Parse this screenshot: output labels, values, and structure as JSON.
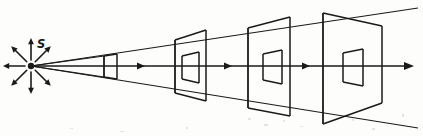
{
  "figure": {
    "kind": "line-diagram",
    "background_color": "#fdfdfc",
    "ink_color": "#1a1a1a",
    "width": 423,
    "height": 136
  },
  "source": {
    "label": "S",
    "label_x": 37,
    "label_y": 48,
    "point_x": 31,
    "point_y": 66,
    "dot_radius": 3.2,
    "radiating_arrow_count": 8,
    "radiating_arrow_length": 22,
    "radiating_arrow_inner_gap": 6,
    "radiating_arrow_angles_deg": [
      0,
      45,
      90,
      135,
      180,
      225,
      270,
      315
    ]
  },
  "axis": {
    "y": 66,
    "start_x": 31,
    "end_x": 412,
    "arrow_head_xs": [
      145,
      232,
      310,
      412
    ],
    "arrow_head_size": 6.5
  },
  "cone": {
    "apex_x": 31,
    "apex_y": 66,
    "upper_end_x": 418,
    "upper_end_y": 8,
    "lower_end_x": 418,
    "lower_end_y": 128,
    "description": "Two straight lines diverging from the source through the top and bottom front corners of every aperture"
  },
  "apertures": [
    {
      "index": 1,
      "name": "aperture-1",
      "front_x": 104,
      "front_top_y": 56,
      "front_bottom_y": 77,
      "back_x": 117,
      "back_top_y": 54,
      "back_bottom_y": 79,
      "inner_front_x": 0,
      "has_inner_square": false,
      "relative_area": 1
    },
    {
      "index": 2,
      "name": "aperture-2",
      "front_x": 175,
      "front_top_y": 40,
      "front_bottom_y": 93,
      "back_x": 206,
      "back_top_y": 30,
      "back_bottom_y": 101,
      "inner_front_x": 182,
      "inner_front_top_y": 56,
      "inner_front_bottom_y": 79,
      "inner_back_x": 199,
      "inner_back_top_y": 52,
      "inner_back_bottom_y": 83,
      "has_inner_square": true,
      "relative_area": 4
    },
    {
      "index": 3,
      "name": "aperture-3",
      "front_x": 248,
      "front_top_y": 28,
      "front_bottom_y": 108,
      "back_x": 290,
      "back_top_y": 17,
      "back_bottom_y": 116,
      "inner_front_x": 263,
      "inner_front_top_y": 54,
      "inner_front_bottom_y": 80,
      "inner_back_x": 282,
      "inner_back_top_y": 50,
      "inner_back_bottom_y": 84,
      "has_inner_square": true,
      "relative_area": 9
    },
    {
      "index": 4,
      "name": "aperture-4",
      "front_x": 323,
      "front_top_y": 13,
      "front_bottom_y": 124,
      "back_x": 382,
      "back_top_y": 26,
      "back_bottom_y": 103,
      "inner_front_x": 343,
      "inner_front_top_y": 53,
      "inner_front_bottom_y": 82,
      "inner_back_x": 363,
      "inner_back_top_y": 49,
      "inner_back_bottom_y": 86,
      "has_inner_square": true,
      "relative_area": 16
    }
  ]
}
